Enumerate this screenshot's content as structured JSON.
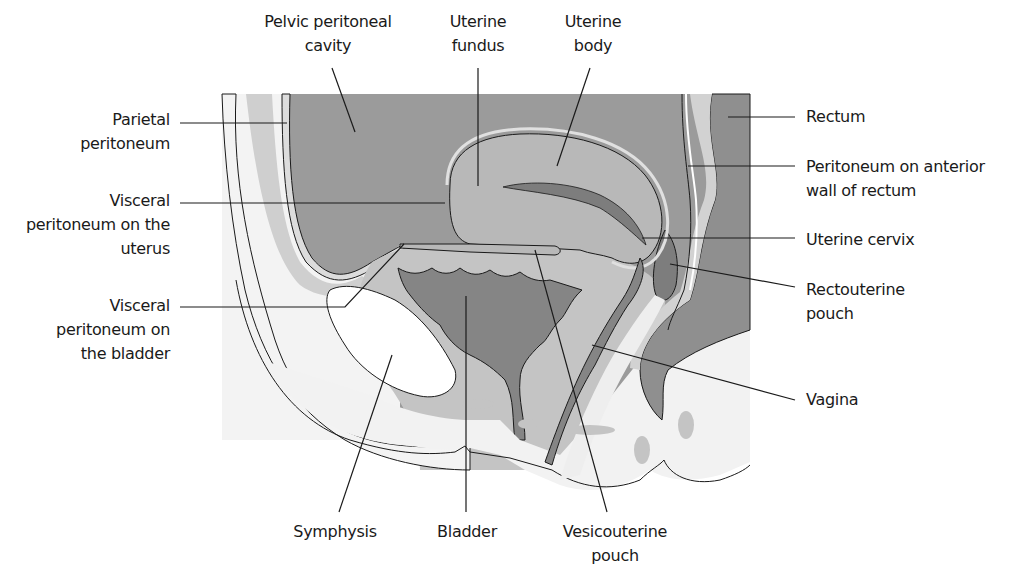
{
  "diagram": {
    "colors": {
      "cavity": "#9b9b9b",
      "organ": "#b8b8b8",
      "lumen": "#7d7d7d",
      "tissue_light": "#f2f2f2",
      "tissue_mid": "#cfcfcf",
      "line": "#1a1a1a"
    },
    "labels": {
      "pelvic_peritoneal_cavity": [
        "Pelvic peritoneal",
        "cavity"
      ],
      "uterine_fundus": [
        "Uterine",
        "fundus"
      ],
      "uterine_body": [
        "Uterine",
        "body"
      ],
      "parietal_peritoneum": [
        "Parietal",
        "peritoneum"
      ],
      "visceral_peritoneum_uterus": [
        "Visceral",
        "peritoneum on the",
        "uterus"
      ],
      "visceral_peritoneum_bladder": [
        "Visceral",
        "peritoneum on",
        "the bladder"
      ],
      "rectum": [
        "Rectum"
      ],
      "peritoneum_rectum": [
        "Peritoneum on anterior",
        "wall of rectum"
      ],
      "uterine_cervix": [
        "Uterine cervix"
      ],
      "rectouterine_pouch": [
        "Rectouterine",
        "pouch"
      ],
      "vagina": [
        "Vagina"
      ],
      "symphysis": [
        "Symphysis"
      ],
      "bladder": [
        "Bladder"
      ],
      "vesicouterine_pouch": [
        "Vesicouterine",
        "pouch"
      ]
    }
  }
}
